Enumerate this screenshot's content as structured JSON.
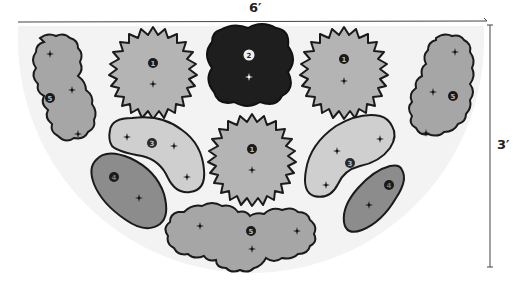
{
  "diagram": {
    "type": "planting-plan",
    "dimensions": {
      "width_label": "6′",
      "height_label": "3′"
    },
    "colors": {
      "bed": "#f2f2f2",
      "plant_1": "#b4b4b4",
      "plant_2": "#1e1e1e",
      "plant_3": "#cfcfcf",
      "plant_4": "#8c8c8c",
      "plant_5": "#a6a6a6",
      "outline": "#1a1a1a"
    },
    "plants": [
      {
        "id": "p1-left",
        "number": "1",
        "shape": "starburst",
        "cx": 152,
        "cy": 72
      },
      {
        "id": "p2-center",
        "number": "2",
        "shape": "wavy-blob",
        "cx": 250,
        "cy": 63
      },
      {
        "id": "p1-right",
        "number": "1",
        "shape": "starburst",
        "cx": 343,
        "cy": 72
      },
      {
        "id": "p1-middle",
        "number": "1",
        "shape": "starburst",
        "cx": 252,
        "cy": 160
      },
      {
        "id": "p5-left",
        "number": "5",
        "shape": "cloud",
        "cx": 65,
        "cy": 95
      },
      {
        "id": "p5-right",
        "number": "5",
        "shape": "cloud",
        "cx": 450,
        "cy": 90
      },
      {
        "id": "p5-bottom",
        "number": "5",
        "shape": "cloud",
        "cx": 250,
        "cy": 232
      },
      {
        "id": "p3-left",
        "number": "3",
        "shape": "kidney",
        "cx": 155,
        "cy": 155
      },
      {
        "id": "p3-right",
        "number": "3",
        "shape": "kidney",
        "cx": 350,
        "cy": 158
      },
      {
        "id": "p4-left",
        "number": "4",
        "shape": "oval",
        "cx": 130,
        "cy": 194
      },
      {
        "id": "p4-right",
        "number": "4",
        "shape": "oval",
        "cx": 380,
        "cy": 190
      }
    ]
  }
}
